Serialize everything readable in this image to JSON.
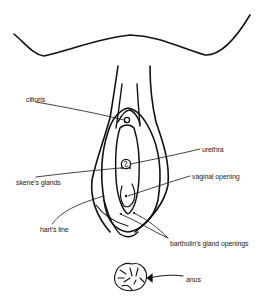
{
  "diagram": {
    "type": "anatomical line drawing",
    "stroke_color": "#111111",
    "background": "#ffffff",
    "labels": [
      {
        "id": "clitoris",
        "text": "clitoris",
        "x": 26,
        "y": 96
      },
      {
        "id": "urethra",
        "text": "urethra",
        "x": 202,
        "y": 146
      },
      {
        "id": "skenes-glands",
        "text": "skene's glands",
        "x": 16,
        "y": 179
      },
      {
        "id": "vaginal-opening",
        "text": "vaginal opening",
        "x": 192,
        "y": 173
      },
      {
        "id": "harts-line",
        "text": "hart's line",
        "x": 40,
        "y": 226
      },
      {
        "id": "bartholins-gland-openings",
        "text": "bartholin's gland openings",
        "x": 170,
        "y": 240
      },
      {
        "id": "anus",
        "text": "anus",
        "x": 186,
        "y": 276
      }
    ]
  }
}
